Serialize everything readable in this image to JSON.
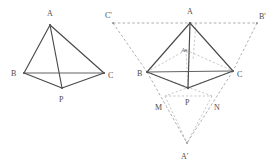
{
  "figure": {
    "background_color": "#ffffff",
    "solid_line_color": "#4a4a4a",
    "dashed_line_color": "#9a9a9a",
    "label_color": "#4d4d4d",
    "left_diagram": {
      "name": "tetrahedron-abcp",
      "labels": {
        "a": "A",
        "b": "B",
        "c": "C",
        "p": "P"
      },
      "vertices": {
        "a": {
          "x": 50,
          "y": 25
        },
        "b": {
          "x": 24,
          "y": 73
        },
        "c": {
          "x": 104,
          "y": 73
        },
        "p": {
          "x": 62,
          "y": 88
        }
      },
      "label_positions": {
        "a": {
          "x": 47,
          "y": 16
        },
        "b": {
          "x": 11,
          "y": 76
        },
        "c": {
          "x": 108,
          "y": 78
        },
        "p": {
          "x": 59,
          "y": 102
        }
      }
    },
    "right_diagram": {
      "name": "tetrahedron-abcp-with-unfolding",
      "labels": {
        "a": "A",
        "b": "B",
        "c": "C",
        "p": "P",
        "a1": "A₁",
        "a_prime": "A'",
        "b_prime": "B'",
        "c_prime": "C'",
        "m": "M",
        "n": "N"
      },
      "vertices": {
        "a": {
          "x": 190,
          "y": 23
        },
        "b": {
          "x": 147,
          "y": 72
        },
        "c": {
          "x": 233,
          "y": 71
        },
        "p": {
          "x": 188,
          "y": 88
        },
        "a1": {
          "x": 186,
          "y": 50
        },
        "a_prime": {
          "x": 187,
          "y": 143
        },
        "b_prime": {
          "x": 257,
          "y": 23
        },
        "c_prime": {
          "x": 118,
          "y": 23
        },
        "m": {
          "x": 165,
          "y": 96
        },
        "n": {
          "x": 212,
          "y": 96
        }
      },
      "label_positions": {
        "a": {
          "x": 187,
          "y": 14
        },
        "b": {
          "x": 137,
          "y": 76
        },
        "c": {
          "x": 237,
          "y": 77
        },
        "p": {
          "x": 185,
          "y": 103
        },
        "a1": {
          "x": 183,
          "y": 50
        },
        "a_prime": {
          "x": 182,
          "y": 157
        },
        "b_prime": {
          "x": 261,
          "y": 19
        },
        "c_prime": {
          "x": 107,
          "y": 18
        },
        "m": {
          "x": 156,
          "y": 108
        },
        "n": {
          "x": 215,
          "y": 108
        }
      }
    }
  }
}
